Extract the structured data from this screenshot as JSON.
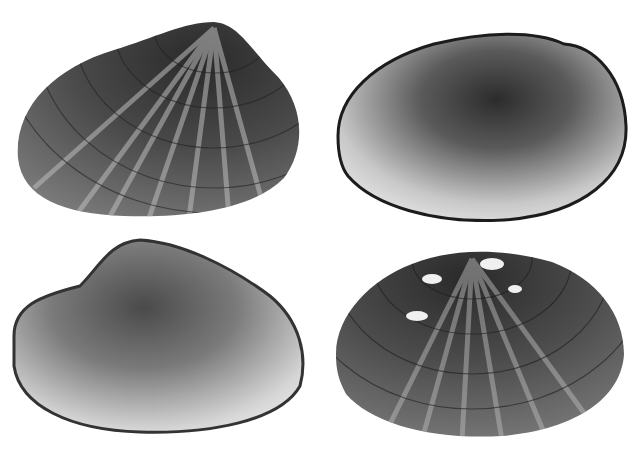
{
  "image": {
    "width": 644,
    "height": 451,
    "background": "#ffffff",
    "description": "Grayscale photograph of four freshwater mussel shells arranged in a 2x2 grid"
  },
  "shells": [
    {
      "position": "top-left",
      "view": "exterior",
      "pattern": "radial dark rays with concentric growth lines",
      "box": [
        14,
        18,
        292,
        202
      ]
    },
    {
      "position": "top-right",
      "view": "interior",
      "pattern": "smooth nacre with dark center",
      "box": [
        334,
        26,
        294,
        196
      ]
    },
    {
      "position": "bottom-left",
      "view": "interior",
      "pattern": "smooth nacre, lighter",
      "box": [
        10,
        236,
        300,
        200
      ]
    },
    {
      "position": "bottom-right",
      "view": "exterior",
      "pattern": "radial dark rays with white eroded umbo",
      "box": [
        332,
        244,
        296,
        196
      ]
    }
  ],
  "colors": {
    "dark": "#1e1e1e",
    "mid": "#6a6a6a",
    "light": "#d8d8d8",
    "nacre_light": "#f0f0f0"
  }
}
